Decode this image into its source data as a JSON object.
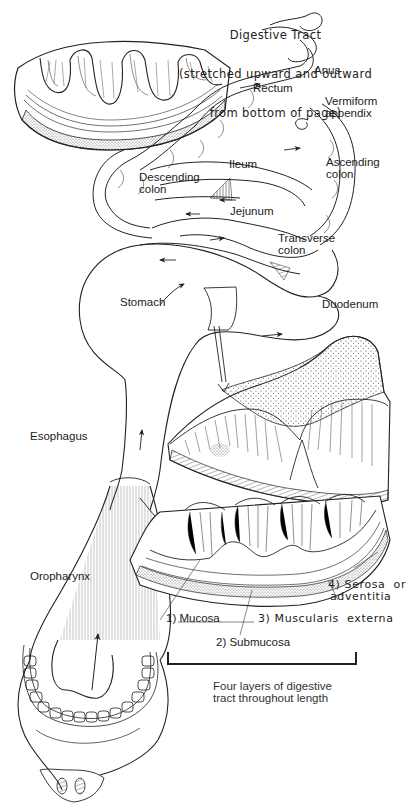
{
  "title": {
    "line1": "Digestive Tract",
    "line2": "(stretched upward and outward",
    "line3": "from bottom of page)"
  },
  "labels": {
    "anus": "Anus",
    "rectum": "Rectum",
    "vermiform_appendix_1": "Vermiform",
    "vermiform_appendix_2": "appendix",
    "ileum": "Ileum",
    "ascending_colon_1": "Ascending",
    "ascending_colon_2": "colon",
    "descending_colon_1": "Descending",
    "descending_colon_2": "colon",
    "jejunum": "Jejunum",
    "transverse_colon_1": "Transverse",
    "transverse_colon_2": "colon",
    "stomach": "Stomach",
    "duodenum": "Duodenum",
    "esophagus": "Esophagus",
    "oropharynx": "Oropharynx"
  },
  "layers": {
    "mucosa": "1) Mucosa",
    "submucosa": "2) Submucosa",
    "muscularis": "3) Muscularis  externa",
    "serosa_1": "4) Serosa  or",
    "serosa_2": "adventitia",
    "caption_1": "Four layers of digestive",
    "caption_2": "tract throughout length"
  },
  "colors": {
    "ink": "#1e1e1e",
    "paper": "#ffffff",
    "stipple": "#555555"
  }
}
